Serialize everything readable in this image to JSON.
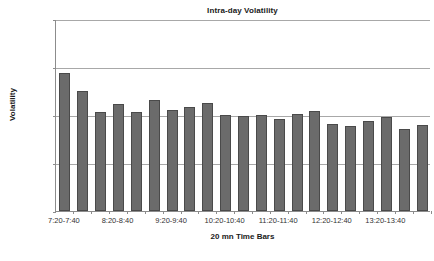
{
  "chart_data": {
    "type": "bar",
    "title": "Intra-day Volatility",
    "xlabel": "20 mn Time Bars",
    "ylabel": "Volatility",
    "ylim": [
      0,
      0.2
    ],
    "ytick_labels": [
      "0.20%",
      "0.15%",
      "0.10%",
      "0.05%",
      "0.00%"
    ],
    "ytick_values": [
      0.2,
      0.15,
      0.1,
      0.05,
      0.0
    ],
    "grid": true,
    "legend": "none",
    "bar_color": "#6b6b6b",
    "categories": [
      "7:20-7:40",
      "7:40-8:00",
      "8:00-8:20",
      "8:20-8:40",
      "8:40-9:00",
      "9:00-9:20",
      "9:20-9:40",
      "9:40-10:00",
      "10:00-10:20",
      "10:20-10:40",
      "10:40-11:00",
      "11:00-11:20",
      "11:20-11:40",
      "11:40-12:00",
      "12:00-12:20",
      "12:20-12:40",
      "12:40-13:00",
      "13:00-13:20",
      "13:20-13:40",
      "13:40-14:00",
      "14:00-14:20"
    ],
    "values": [
      0.1435,
      0.1245,
      0.1035,
      0.111,
      0.1035,
      0.1155,
      0.1055,
      0.108,
      0.1125,
      0.0995,
      0.0985,
      0.1005,
      0.0955,
      0.1015,
      0.1045,
      0.091,
      0.0885,
      0.0935,
      0.098,
      0.0855,
      0.0895
    ],
    "visible_xtick_labels": [
      {
        "index": 0,
        "label": "7:20-7:40"
      },
      {
        "index": 3,
        "label": "8:20-8:40"
      },
      {
        "index": 6,
        "label": "9:20-9:40"
      },
      {
        "index": 9,
        "label": "10:20-10:40"
      },
      {
        "index": 12,
        "label": "11:20-11:40"
      },
      {
        "index": 15,
        "label": "12:20-12:40"
      },
      {
        "index": 18,
        "label": "13:20-13:40"
      }
    ]
  }
}
